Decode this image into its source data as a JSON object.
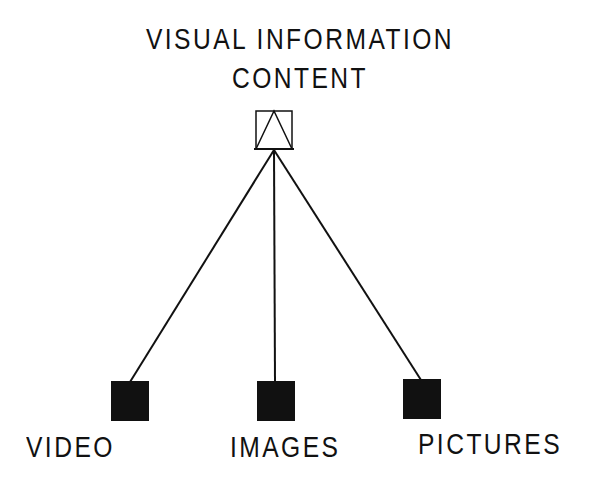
{
  "diagram": {
    "title": {
      "line1": "VISUAL INFORMATION",
      "line2": "CONTENT"
    },
    "root_node": {
      "label": "VISUAL INFORMATION CONTENT",
      "icon": "square-with-triangle-icon",
      "style": "outline"
    },
    "children": [
      {
        "label": "VIDEO",
        "icon": "filled-square-icon"
      },
      {
        "label": "IMAGES",
        "icon": "filled-square-icon"
      },
      {
        "label": "PICTURES",
        "icon": "filled-square-icon"
      }
    ],
    "colors": {
      "ink": "#111111",
      "background": "#ffffff"
    }
  }
}
